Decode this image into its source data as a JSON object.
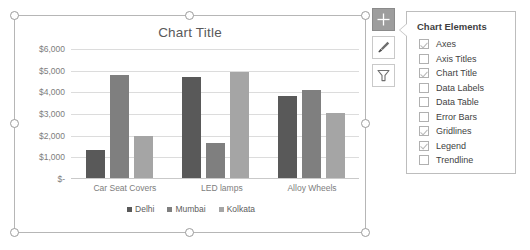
{
  "chart": {
    "title": "Chart Title",
    "buttons": [
      {
        "name": "chart-elements-button",
        "icon": "plus-icon",
        "active": true
      },
      {
        "name": "chart-styles-button",
        "icon": "paintbrush-icon",
        "active": false
      },
      {
        "name": "chart-filters-button",
        "icon": "funnel-icon",
        "active": false
      }
    ]
  },
  "chart_data": {
    "type": "bar",
    "title": "Chart Title",
    "xlabel": "",
    "ylabel": "",
    "ylim": [
      0,
      6000
    ],
    "yticks": [
      "$-",
      "$1,000",
      "$2,000",
      "$3,000",
      "$4,000",
      "$5,000",
      "$6,000"
    ],
    "ytick_values": [
      0,
      1000,
      2000,
      3000,
      4000,
      5000,
      6000
    ],
    "grid": true,
    "legend_position": "bottom",
    "categories": [
      "Car Seat Covers",
      "LED lamps",
      "Alloy Wheels"
    ],
    "series": [
      {
        "name": "Delhi",
        "color": "#595959",
        "values": [
          1270,
          4650,
          3800
        ]
      },
      {
        "name": "Mumbai",
        "color": "#7f7f7f",
        "values": [
          4760,
          1620,
          4060
        ]
      },
      {
        "name": "Kolkata",
        "color": "#a5a5a5",
        "values": [
          1930,
          4910,
          3010
        ]
      }
    ]
  },
  "panel": {
    "heading": "Chart Elements",
    "items": [
      {
        "label": "Axes",
        "checked": true
      },
      {
        "label": "Axis Titles",
        "checked": false
      },
      {
        "label": "Chart Title",
        "checked": true
      },
      {
        "label": "Data Labels",
        "checked": false
      },
      {
        "label": "Data Table",
        "checked": false
      },
      {
        "label": "Error Bars",
        "checked": false
      },
      {
        "label": "Gridlines",
        "checked": true
      },
      {
        "label": "Legend",
        "checked": true
      },
      {
        "label": "Trendline",
        "checked": false
      }
    ]
  }
}
